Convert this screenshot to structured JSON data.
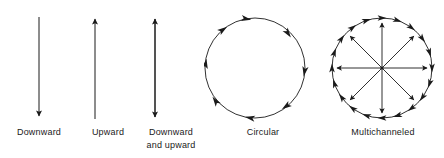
{
  "figure": {
    "width": 444,
    "height": 158,
    "background": "#ffffff",
    "stroke_color": "#1a1a1a",
    "text_color": "#1a1a1a"
  },
  "panels": [
    {
      "key": "downward",
      "icon": "downward-arrow-icon",
      "caption_line1": "Downward",
      "caption_line2": ""
    },
    {
      "key": "upward",
      "icon": "upward-arrow-icon",
      "caption_line1": "Upward",
      "caption_line2": ""
    },
    {
      "key": "down-up",
      "icon": "double-headed-vertical-arrow-icon",
      "caption_line1": "Downward",
      "caption_line2": "and  upward"
    },
    {
      "key": "circular",
      "icon": "clockwise-circular-arrow-icon",
      "caption_line1": "Circular",
      "caption_line2": ""
    },
    {
      "key": "multichanneled",
      "icon": "multichanneled-radial-circle-icon",
      "caption_line1": "Multichanneled",
      "caption_line2": ""
    }
  ]
}
